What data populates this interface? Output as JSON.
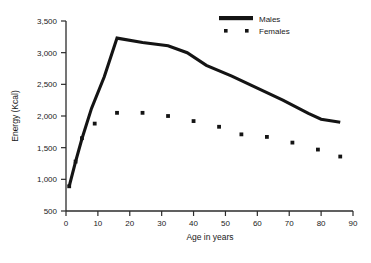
{
  "chart_data": {
    "type": "line",
    "title": "",
    "xlabel": "Age in years",
    "ylabel": "Energy (Kcal)",
    "xlim": [
      0,
      90
    ],
    "ylim": [
      500,
      3500
    ],
    "xticks": [
      0,
      10,
      20,
      30,
      40,
      50,
      60,
      70,
      80,
      90
    ],
    "xtick_labels": [
      "0",
      "10",
      "20",
      "30",
      "40",
      "50",
      "60",
      "70",
      "80",
      "90"
    ],
    "yticks": [
      500,
      1000,
      1500,
      2000,
      2500,
      3000,
      3500
    ],
    "ytick_labels": [
      "500",
      "1,000",
      "1,500",
      "2,000",
      "2,500",
      "3,000",
      "3,500"
    ],
    "grid": false,
    "legend_position": "top-right",
    "series": [
      {
        "name": "Males",
        "style": "line",
        "color": "#141414",
        "x": [
          1,
          3,
          5,
          8,
          12,
          16,
          24,
          32,
          38,
          44,
          52,
          60,
          68,
          76,
          80,
          86
        ],
        "values": [
          890,
          1280,
          1640,
          2120,
          2620,
          3230,
          3160,
          3110,
          3000,
          2800,
          2630,
          2440,
          2250,
          2040,
          1950,
          1900
        ]
      },
      {
        "name": "Females",
        "style": "markers",
        "color": "#141414",
        "x": [
          1,
          3,
          5,
          9,
          16,
          24,
          32,
          40,
          48,
          55,
          63,
          71,
          79,
          86
        ],
        "values": [
          890,
          1280,
          1650,
          1880,
          2050,
          2050,
          2000,
          1920,
          1830,
          1710,
          1670,
          1580,
          1470,
          1360
        ]
      }
    ],
    "legend": [
      {
        "label": "Males",
        "marker": "line"
      },
      {
        "label": "Females",
        "marker": "squares"
      }
    ]
  }
}
